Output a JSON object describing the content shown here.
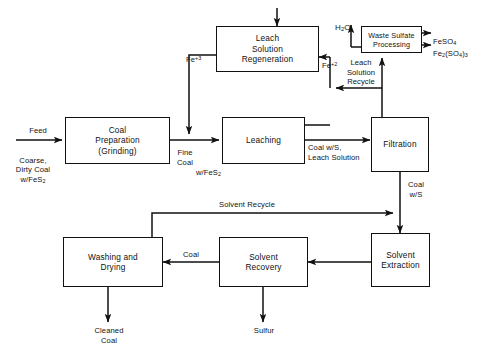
{
  "diagram": {
    "line_color": "#111111",
    "background_color": "#ffffff"
  },
  "nodes": [
    {
      "id": "coal-preparation",
      "label": "Coal\nPreparation\n(Grinding)"
    },
    {
      "id": "leaching",
      "label": "Leaching"
    },
    {
      "id": "leach-solution-regeneration",
      "label": "Leach\nSolution\nRegeneration"
    },
    {
      "id": "waste-sulfate-processing",
      "label": "Waste   Sulfate\nProcessing"
    },
    {
      "id": "filtration",
      "label": "Filtration"
    },
    {
      "id": "solvent-extraction",
      "label": "Solvent\nExtraction"
    },
    {
      "id": "solvent-recovery",
      "label": "Solvent\nRecovery"
    },
    {
      "id": "washing-and-drying",
      "label": "Washing   and\nDrying"
    }
  ],
  "edge_labels": {
    "feed": "Feed",
    "feed_stream": "Coarse,\nDirty Coal\nw/FeS",
    "feed_stream_sub": "2",
    "fine_coal": "Fine\nCoal",
    "fine_coal_wfes2_prefix": "w/FeS",
    "fine_coal_wfes2_sub": "2",
    "fe3_text": "Fe",
    "fe3_sup": "+3",
    "fe2_text": "Fe",
    "fe2_sup": "+2",
    "h2o_pre": "H",
    "h2o_sub": "2",
    "h2o_post": "O",
    "coal_ws_leach_solution": "Coal   w/S,\nLeach Solution",
    "leach_solution_recycle": "Leach\nSolution\nRecycle",
    "coal_ws": "Coal\nw/S",
    "solvent_recycle": "Solvent   Recycle",
    "coal": "Coal",
    "sulfur": "Sulfur",
    "cleaned_coal": "Cleaned\nCoal"
  },
  "products": {
    "feso4_main": "FeSO",
    "feso4_sub": "4",
    "fe2so43_a": "Fe",
    "fe2so43_sub1": "2",
    "fe2so43_b": "(SO",
    "fe2so43_sub2": "4",
    "fe2so43_c": ")",
    "fe2so43_sub3": "3"
  }
}
